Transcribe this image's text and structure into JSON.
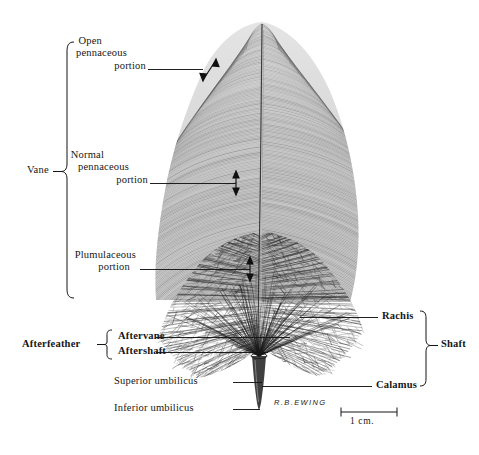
{
  "figure": {
    "background_color": "#ffffff",
    "ink_color": "#161616",
    "width": 479,
    "height": 455
  },
  "labels": {
    "vane": "Vane",
    "open_pennaceous": {
      "line1": "Open",
      "line2": "pennaceous",
      "line3": "portion"
    },
    "normal_pennaceous": {
      "line1": "Normal",
      "line2": "pennaceous",
      "line3": "portion"
    },
    "plumulaceous": {
      "line1": "Plumulaceous",
      "line2": "portion"
    },
    "afterfeather": "Afterfeather",
    "aftervane": "Aftervane",
    "aftershaft": "Aftershaft",
    "superior_umbilicus": "Superior umbilicus",
    "inferior_umbilicus": "Inferior umbilicus",
    "rachis": "Rachis",
    "calamus": "Calamus",
    "shaft": "Shaft"
  },
  "scale_bar": {
    "caption": "1 cm.",
    "length_px": 56
  },
  "signature": {
    "text": "R.B.EWING"
  },
  "icons": {
    "vane_bracket": "left-brace-icon",
    "afterfeather_bracket": "left-brace-icon",
    "shaft_bracket": "right-brace-icon",
    "open_pennaceous_arrow": "double-headed-arrow-icon",
    "normal_pennaceous_arrow": "double-headed-arrow-icon",
    "plumulaceous_arrow": "double-headed-arrow-icon",
    "scale_bar_icon": "scale-bar-icon",
    "feather": "feather-illustration-icon"
  }
}
